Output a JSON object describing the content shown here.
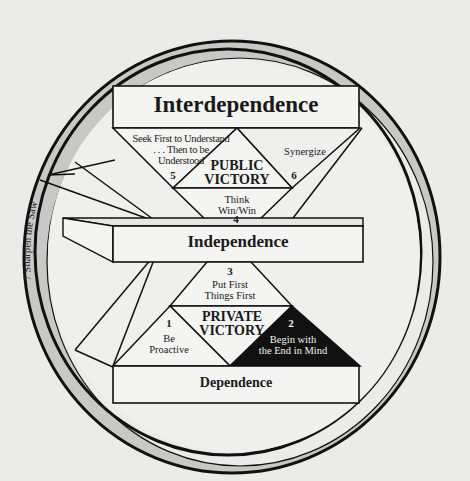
{
  "diagram": {
    "ring_label": "7  Sharpen the Saw",
    "levels": {
      "top": "Interdependence",
      "middle": "Independence",
      "bottom": "Dependence"
    },
    "victories": {
      "public": [
        "PUBLIC",
        "VICTORY"
      ],
      "private": [
        "PRIVATE",
        "VICTORY"
      ]
    },
    "habits": [
      {
        "number": "1",
        "lines": [
          "Be",
          "Proactive"
        ]
      },
      {
        "number": "2",
        "lines": [
          "Begin with",
          "the End in Mind"
        ]
      },
      {
        "number": "3",
        "lines": [
          "Put First",
          "Things First"
        ]
      },
      {
        "number": "4",
        "lines": [
          "Think",
          "Win/Win"
        ]
      },
      {
        "number": "5",
        "lines": [
          "Seek First to Understand",
          ". . . Then to be",
          "Understood"
        ]
      },
      {
        "number": "6",
        "lines": [
          "Synergize"
        ]
      },
      {
        "number": "7",
        "lines": [
          "Sharpen the Saw"
        ]
      }
    ],
    "colors": {
      "background": "#ebebe9",
      "ring_fill": "#c8c8c6",
      "stroke": "#111111",
      "habit2_fill": "#111111",
      "box_fill": "#f4f4f2"
    }
  }
}
